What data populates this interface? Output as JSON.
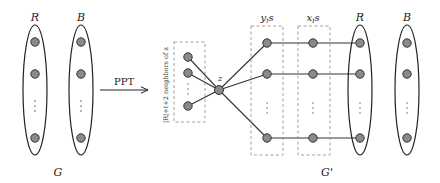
{
  "left_graph": {
    "name": "G",
    "sets": [
      {
        "label": "R",
        "cx": 35,
        "nodes_y": [
          42,
          74,
          138
        ],
        "dots_y": [
          101,
          106,
          111
        ]
      },
      {
        "label": "B",
        "cx": 81,
        "nodes_y": [
          42,
          74,
          138
        ],
        "dots_y": [
          101,
          106,
          111
        ]
      }
    ]
  },
  "transform": {
    "label": "PPT",
    "arrow": {
      "x1": 100,
      "x2": 148,
      "y": 90
    }
  },
  "right_graph": {
    "name": "G'",
    "center_node": {
      "label": "z",
      "x": 219,
      "y": 90
    },
    "neighbor_box": {
      "label": "|R|+t+2 neighbors of z",
      "x": 174,
      "y": 42,
      "w": 31,
      "h": 80,
      "nodes": [
        {
          "x": 188,
          "y": 57
        },
        {
          "x": 188,
          "y": 73
        },
        {
          "x": 188,
          "y": 106
        }
      ]
    },
    "y_box": {
      "label": "y_i s",
      "label_main": "y",
      "label_sub": "i",
      "label_tail": "s",
      "x": 251,
      "y": 26,
      "w": 32,
      "h": 129,
      "node_x": 267
    },
    "x_box": {
      "label": "x_i s",
      "label_main": "x",
      "label_sub": "i",
      "label_tail": "s",
      "x": 298,
      "y": 26,
      "w": 32,
      "h": 129,
      "node_x": 313
    },
    "rows_y": [
      43,
      74,
      138
    ],
    "sets": [
      {
        "label": "R",
        "cx": 360
      },
      {
        "label": "B",
        "cx": 407
      }
    ]
  }
}
